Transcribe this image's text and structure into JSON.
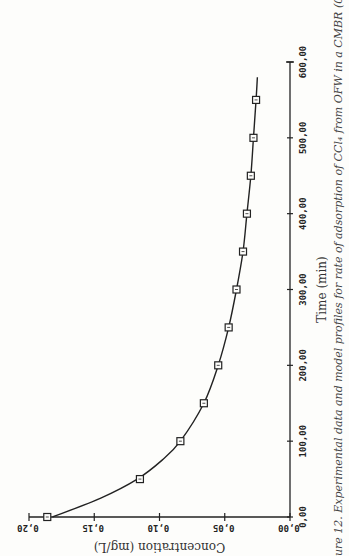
{
  "chart_data": {
    "type": "line",
    "title": "",
    "caption": "ure 12. Experimental data and model profiles for rate of adsorption of CCl₄ from OFW in a CMBR (0.19 g/L",
    "xlabel": "Time (min)",
    "ylabel": "Concentration (mg/L)",
    "xlim": [
      0,
      600
    ],
    "ylim": [
      0,
      0.2
    ],
    "x_ticks": [
      "0,00",
      "100,00",
      "200,00",
      "300,00",
      "400,00",
      "500,00",
      "600,00"
    ],
    "x_tick_values": [
      0,
      100,
      200,
      300,
      400,
      500,
      600
    ],
    "y_ticks": [
      "0,00",
      "0,05",
      "0,10",
      "0,15",
      "0,20"
    ],
    "y_tick_values": [
      0,
      0.05,
      0.1,
      0.15,
      0.2
    ],
    "grid": false,
    "orientation": "rotated 90° (time axis vertical on right, concentration axis horizontal at bottom, upside-down labels)",
    "series": [
      {
        "name": "Experimental data",
        "marker": "square",
        "x": [
          0,
          50,
          100,
          150,
          200,
          250,
          300,
          350,
          400,
          450,
          500,
          550
        ],
        "values": [
          0.186,
          0.115,
          0.084,
          0.066,
          0.055,
          0.047,
          0.041,
          0.036,
          0.033,
          0.03,
          0.028,
          0.026
        ]
      },
      {
        "name": "Model profile",
        "marker": "none",
        "x": [
          0,
          25,
          50,
          75,
          100,
          150,
          200,
          250,
          300,
          350,
          400,
          450,
          500,
          550,
          580
        ],
        "values": [
          0.182,
          0.145,
          0.117,
          0.098,
          0.084,
          0.066,
          0.055,
          0.047,
          0.041,
          0.036,
          0.033,
          0.03,
          0.028,
          0.026,
          0.025
        ]
      }
    ]
  }
}
